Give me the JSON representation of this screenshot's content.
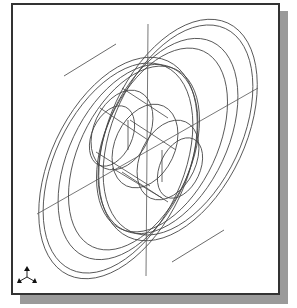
{
  "viewport": {
    "type": "CAD isometric wireframe view",
    "subject": "wheel / pulley with hub",
    "colors": {
      "background": "#ffffff",
      "frame_border": "#333333",
      "shadow": "#9a9a9a",
      "line": "#444444"
    }
  },
  "model": {
    "rotation_deg": 25,
    "rims": [
      {
        "cx": 118,
        "cy": 168,
        "rx": 68,
        "ry": 118
      },
      {
        "cx": 118,
        "cy": 168,
        "rx": 64,
        "ry": 112
      },
      {
        "cx": 128,
        "cy": 162,
        "rx": 60,
        "ry": 104
      },
      {
        "cx": 134,
        "cy": 158,
        "rx": 56,
        "ry": 98
      },
      {
        "cx": 162,
        "cy": 140,
        "rx": 56,
        "ry": 98
      },
      {
        "cx": 168,
        "cy": 136,
        "rx": 60,
        "ry": 104
      },
      {
        "cx": 178,
        "cy": 130,
        "rx": 64,
        "ry": 112
      },
      {
        "cx": 178,
        "cy": 130,
        "rx": 68,
        "ry": 118
      }
    ],
    "hub": [
      {
        "cx": 122,
        "cy": 130,
        "rx": 28,
        "ry": 42
      },
      {
        "cx": 112,
        "cy": 136,
        "rx": 20,
        "ry": 32
      },
      {
        "cx": 168,
        "cy": 160,
        "rx": 28,
        "ry": 42
      },
      {
        "cx": 180,
        "cy": 168,
        "rx": 20,
        "ry": 32
      },
      {
        "cx": 145,
        "cy": 146,
        "rx": 30,
        "ry": 44
      }
    ],
    "axes": [
      {
        "x1": 148,
        "y1": 24,
        "x2": 146,
        "y2": 276
      },
      {
        "x1": 37,
        "y1": 214,
        "x2": 258,
        "y2": 88
      }
    ],
    "tangents": [
      {
        "x1": 64,
        "y1": 76,
        "x2": 116,
        "y2": 44
      },
      {
        "x1": 172,
        "y1": 262,
        "x2": 224,
        "y2": 230
      }
    ]
  },
  "triad_icon": {
    "name": "coordinate-axes-triad",
    "cx": 27,
    "cy": 277
  }
}
